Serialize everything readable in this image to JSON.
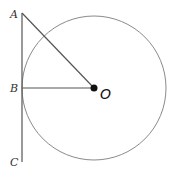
{
  "diagram": {
    "type": "geometry",
    "colors": {
      "stroke": "#555555",
      "circle": "#8a8a8a",
      "center_dot": "#111111",
      "label": "#333333"
    },
    "points": {
      "A": {
        "label": "A",
        "x": 22,
        "y": 13
      },
      "B": {
        "label": "B",
        "x": 22,
        "y": 88
      },
      "C": {
        "label": "C",
        "x": 22,
        "y": 162
      },
      "O": {
        "label": "O",
        "x": 94,
        "y": 88
      }
    },
    "circle": {
      "cx": 94,
      "cy": 88,
      "r": 72
    },
    "segments": [
      {
        "from": "A",
        "to": "C",
        "name": "tangent-line-ac"
      },
      {
        "from": "B",
        "to": "O",
        "name": "radius-bo"
      },
      {
        "from": "A",
        "to": "O",
        "name": "segment-ao"
      }
    ]
  }
}
